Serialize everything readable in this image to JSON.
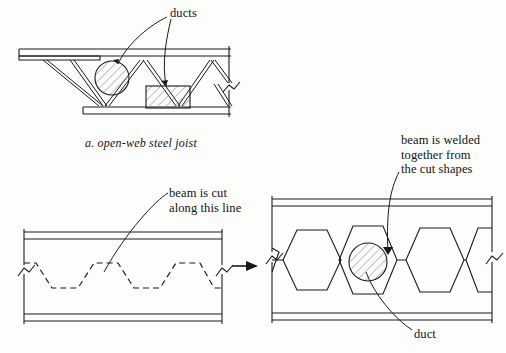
{
  "figure": {
    "title_implicit": "Castellated beam fabrication from open-web steel joist",
    "background_color": "#fdfdfc",
    "line_color": "#1a1a1a",
    "hatch_color": "#9a9a9a"
  },
  "labels": {
    "ducts": "ducts",
    "caption_joist": "a. open-web steel joist",
    "beam_cut": "beam is cut\nalong this line",
    "beam_welded": "beam is welded\ntogether from\nthe cut shapes",
    "duct": "duct"
  },
  "diagrams": {
    "joist": {
      "name": "open-web steel joist",
      "duct_shapes": [
        "circle",
        "rectangle"
      ],
      "break_symbol": true
    },
    "beam_uncut": {
      "name": "wide-flange beam with cut line",
      "cut_line_style": "dashed",
      "cut_line_pattern": "castellated zigzag",
      "break_symbols": 2
    },
    "beam_castellated": {
      "name": "castellated beam with hexagonal openings",
      "opening_shape": "hexagon",
      "opening_count": 4,
      "duct_shape": "circle",
      "break_symbols": 2
    }
  },
  "arrow": {
    "name": "process-arrow",
    "direction": "right"
  }
}
